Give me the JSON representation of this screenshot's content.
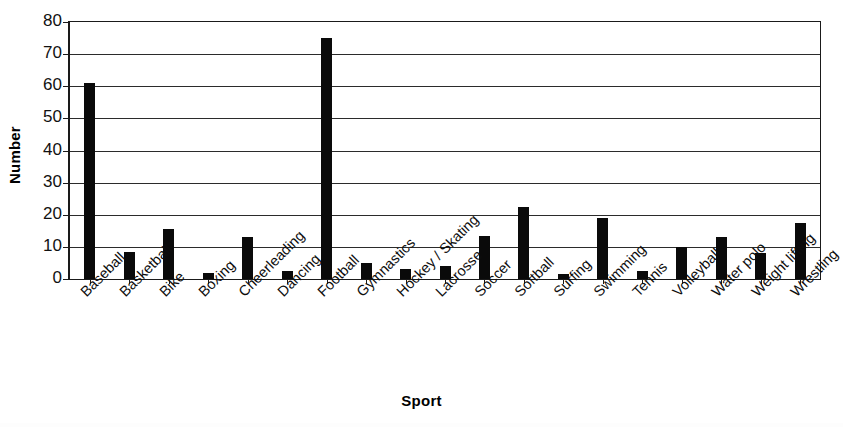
{
  "chart_data": {
    "type": "bar",
    "title": "",
    "xlabel": "Sport",
    "ylabel": "Number",
    "ylim": [
      0,
      80
    ],
    "yticks": [
      0,
      10,
      20,
      30,
      40,
      50,
      60,
      70,
      80
    ],
    "ytick_labels": [
      "0",
      "10",
      "20",
      "30",
      "40",
      "50",
      "60",
      "70",
      "80"
    ],
    "grid": "horizontal",
    "legend": "none",
    "bar_color": "#0a0a0a",
    "categories": [
      "Baseball",
      "Basketball",
      "Bike",
      "Boxing",
      "Cheerleading",
      "Dancing",
      "Football",
      "Gymnastics",
      "Hockey / Skating",
      "Lacrosse",
      "Soccer",
      "Softball",
      "Surfing",
      "Swimming",
      "Tennis",
      "Volleyball",
      "Water polo",
      "Weight lifting",
      "Wrestling"
    ],
    "values": [
      61,
      8.5,
      15.5,
      2,
      13,
      2.5,
      75,
      5,
      3,
      4,
      13.5,
      22.5,
      1.5,
      19,
      2.5,
      10,
      13,
      8,
      17.5
    ]
  }
}
